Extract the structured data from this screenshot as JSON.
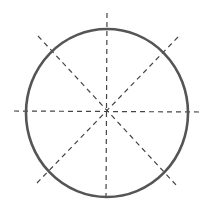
{
  "diagram": {
    "type": "circle-with-symmetry-axes",
    "background": "#ffffff",
    "circle": {
      "cx": 107,
      "cy": 113,
      "rx": 81,
      "ry": 84,
      "stroke": "#555555",
      "stroke_width": 2.6
    },
    "axes_style": {
      "stroke": "#444444",
      "stroke_width": 1.2,
      "dash": "5,4"
    },
    "axes": [
      {
        "name": "vertical-axis",
        "x1": 107,
        "y1": 13,
        "x2": 106,
        "y2": 200
      },
      {
        "name": "horizontal-axis",
        "x1": 14,
        "y1": 111,
        "x2": 200,
        "y2": 112
      },
      {
        "name": "diagonal-axis-tl-br",
        "x1": 38,
        "y1": 36,
        "x2": 177,
        "y2": 186
      },
      {
        "name": "diagonal-axis-tr-bl",
        "x1": 178,
        "y1": 37,
        "x2": 36,
        "y2": 184
      }
    ],
    "axis_count": 4
  }
}
